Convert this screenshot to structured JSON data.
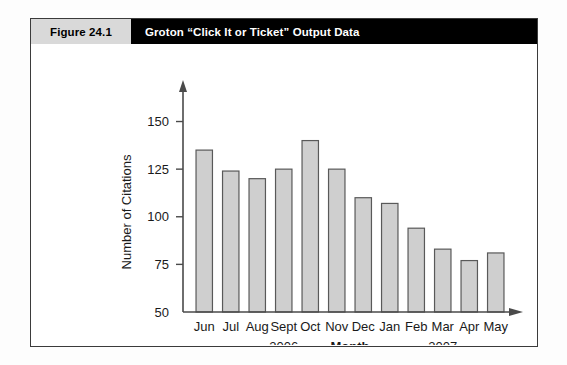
{
  "figure": {
    "number_label": "Figure 24.1",
    "title": "Groton “Click It or Ticket” Output Data"
  },
  "chart_data": {
    "type": "bar",
    "title": "",
    "xlabel": "Month",
    "ylabel": "Number of Citations",
    "categories": [
      "Jun",
      "Jul",
      "Aug",
      "Sept",
      "Oct",
      "Nov",
      "Dec",
      "Jan",
      "Feb",
      "Mar",
      "Apr",
      "May"
    ],
    "values": [
      135,
      124,
      120,
      125,
      140,
      125,
      110,
      107,
      94,
      83,
      77,
      81
    ],
    "ylim": [
      50,
      155
    ],
    "yticks": [
      50,
      75,
      100,
      125,
      150
    ],
    "ytick_labels": [
      "50",
      "75",
      "100",
      "125",
      "150"
    ],
    "grid": false,
    "legend": null,
    "group_labels": [
      {
        "text": "2006",
        "start_category": "Jun",
        "end_category": "Dec"
      },
      {
        "text": "2007",
        "start_category": "Jan",
        "end_category": "May"
      }
    ],
    "colors": {
      "bar_fill": "#cfcfcf",
      "bar_edge": "#595959",
      "axis": "#4a4a4a",
      "text": "#1a1a1a",
      "header_band": "#000000",
      "header_number_band": "#d9d9d9"
    }
  }
}
